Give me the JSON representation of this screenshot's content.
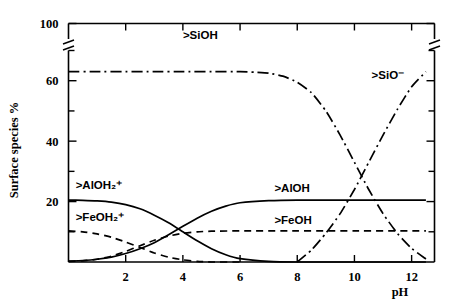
{
  "chart_data": {
    "type": "line",
    "title": "",
    "xlabel": "pH",
    "ylabel": "Surface species  %",
    "xlim": [
      0,
      12.8
    ],
    "ylim": [
      0,
      100
    ],
    "grid": false,
    "legend": "inline-annotations",
    "axis_break": {
      "present": true,
      "between": [
        70,
        100
      ],
      "note": "y-axis compressed between 70 and 100"
    },
    "xticks": [
      2,
      4,
      6,
      8,
      10,
      12
    ],
    "xtick_labels": [
      "2",
      "4",
      "6",
      "8",
      "10",
      "12"
    ],
    "yticks": [
      20,
      40,
      60,
      100
    ],
    "ytick_labels": [
      "20",
      "40",
      "60",
      "100"
    ],
    "yticks_minor": [
      10,
      30,
      50,
      70
    ],
    "series": [
      {
        "name": ">SiOH",
        "label": ">SiOH",
        "style": "dash-dot",
        "label_x": 4.0,
        "label_y": 78,
        "x": [
          0.0,
          1.0,
          2.0,
          3.0,
          4.0,
          5.0,
          6.0,
          6.5,
          7.0,
          7.5,
          8.0,
          8.5,
          9.0,
          9.5,
          10.0,
          10.5,
          11.0,
          11.5,
          12.0,
          12.5
        ],
        "y": [
          63.0,
          63.0,
          63.0,
          63.0,
          63.0,
          63.0,
          63.0,
          62.8,
          62.5,
          61.5,
          59.5,
          56.0,
          50.0,
          42.0,
          33.0,
          24.0,
          16.0,
          9.5,
          4.5,
          1.0
        ]
      },
      {
        "name": ">SiO-",
        "label": ">SiO⁻",
        "style": "dash-dot",
        "label_x": 10.6,
        "label_y": 62,
        "x": [
          8.0,
          8.5,
          9.0,
          9.5,
          10.0,
          10.5,
          11.0,
          11.5,
          12.0,
          12.5
        ],
        "y": [
          0.0,
          4.0,
          9.5,
          16.0,
          24.0,
          33.0,
          42.0,
          50.5,
          58.0,
          63.0
        ]
      },
      {
        "name": ">AlOH2+",
        "label": ">AlOH₂⁺",
        "style": "solid",
        "label_x": 0.25,
        "label_y": 25.5,
        "x": [
          0.0,
          0.5,
          1.0,
          1.5,
          2.0,
          2.5,
          3.0,
          3.5,
          4.0,
          4.5,
          5.0,
          5.5,
          6.0,
          7.0,
          8.0,
          10.0,
          12.5
        ],
        "y": [
          20.5,
          20.4,
          20.2,
          19.8,
          19.0,
          17.6,
          15.5,
          13.0,
          10.0,
          7.0,
          4.4,
          2.4,
          1.1,
          0.2,
          0.0,
          0.0,
          0.0
        ]
      },
      {
        "name": ">AlOH",
        "label": ">AlOH",
        "style": "solid",
        "label_x": 7.2,
        "label_y": 24.5,
        "x": [
          0.0,
          0.5,
          1.0,
          1.5,
          2.0,
          2.5,
          3.0,
          3.5,
          4.0,
          4.5,
          5.0,
          5.5,
          6.0,
          7.0,
          8.0,
          10.0,
          12.0,
          12.5
        ],
        "y": [
          0.3,
          0.5,
          0.9,
          1.6,
          2.8,
          4.4,
          6.4,
          9.0,
          11.8,
          14.5,
          16.8,
          18.5,
          19.6,
          20.3,
          20.5,
          20.5,
          20.5,
          20.5
        ]
      },
      {
        "name": ">FeOH2+",
        "label": ">FeOH₂⁺",
        "style": "dashed",
        "label_x": 0.25,
        "label_y": 15.0,
        "x": [
          0.0,
          0.5,
          1.0,
          1.5,
          2.0,
          2.5,
          3.0,
          3.5,
          4.0,
          4.5,
          5.0,
          6.0
        ],
        "y": [
          10.3,
          10.0,
          9.3,
          8.2,
          6.6,
          4.8,
          3.0,
          1.6,
          0.7,
          0.2,
          0.0,
          0.0
        ]
      },
      {
        "name": ">FeOH",
        "label": ">FeOH",
        "style": "dashed",
        "label_x": 7.2,
        "label_y": 14.0,
        "x": [
          0.0,
          0.5,
          1.0,
          1.5,
          2.0,
          2.5,
          3.0,
          3.5,
          4.0,
          4.5,
          5.0,
          6.0,
          8.0,
          10.0,
          12.5
        ],
        "y": [
          0.2,
          0.4,
          0.9,
          1.9,
          3.5,
          5.4,
          7.2,
          8.6,
          9.5,
          10.0,
          10.2,
          10.3,
          10.3,
          10.3,
          10.3
        ]
      }
    ],
    "colors": {
      "axis": "#000000",
      "curve": "#000000",
      "background": "#ffffff"
    }
  }
}
